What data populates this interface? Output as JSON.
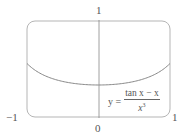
{
  "chart_data": {
    "type": "line",
    "title": "",
    "xlabel": "",
    "ylabel": "",
    "xlim": [
      -1,
      1
    ],
    "ylim": [
      0,
      1
    ],
    "x_tick_labels": [
      "-1",
      "0",
      "1"
    ],
    "y_tick_labels": [
      "1"
    ],
    "grid": false,
    "series": [
      {
        "name": "y = (tan x − x) / x³",
        "x": [
          -1,
          -0.75,
          -0.5,
          -0.25,
          0,
          0.25,
          0.5,
          0.75,
          1
        ],
        "y": [
          0.557,
          0.433,
          0.371,
          0.341,
          0.333,
          0.341,
          0.371,
          0.433,
          0.557
        ]
      }
    ],
    "annotations": [
      {
        "text": "y = (tan x − x) / x³",
        "position": "lower right inside plot"
      }
    ]
  },
  "labels": {
    "y_top": "1",
    "x_left": "−1",
    "x_zero": "0",
    "x_right": "1",
    "formula_lhs": "y =",
    "formula_num": "tan x − x",
    "formula_den_base": "x",
    "formula_den_exp": "3"
  }
}
